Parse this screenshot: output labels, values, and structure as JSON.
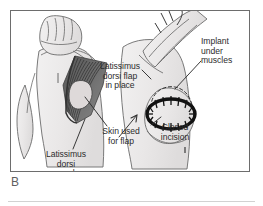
{
  "figure": {
    "panel_label": "B",
    "domain_kind": "medical-illustration",
    "callouts": [
      {
        "id": "latissimus-dorsi-flap-in-place",
        "text": "Latissimus\ndorsi flap\nin place",
        "align": "center"
      },
      {
        "id": "implant-under-muscles",
        "text": "Implant\nunder\nmuscles",
        "align": "left"
      },
      {
        "id": "closed-incision",
        "text": "Closed\nincision",
        "align": "center"
      },
      {
        "id": "skin-used-for-flap",
        "text": "Skin used\nfor flap",
        "align": "center"
      },
      {
        "id": "latissimus-dorsi-muscle",
        "text": "Latissimus\ndorsi\nmuscle",
        "align": "center"
      }
    ]
  },
  "colors": {
    "page_background": "#ffffff",
    "frame_border": "#6d6d6d",
    "bottom_rule": "#d2d2d2",
    "label_text": "#2c2c2c",
    "panel_letter": "#5f5f5f",
    "body_outline": "#6b6b6b",
    "body_fill": "#eceaea",
    "muscle_dark": "#4a4a4a",
    "muscle_mid": "#7d7d7d",
    "skin_paddle": "#dedcdc",
    "incision_black": "#121212",
    "leader_line": "#2f2f2f"
  }
}
